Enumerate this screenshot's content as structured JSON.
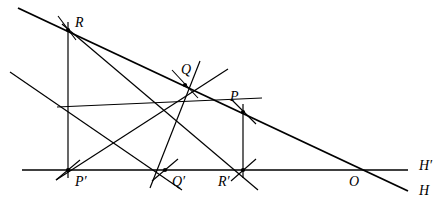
{
  "figure": {
    "background_color": "#ffffff",
    "stroke_color": "#000000",
    "canvas": {
      "width": 448,
      "height": 224
    },
    "points": [
      {
        "id": "R",
        "label": "R",
        "x": 68,
        "y": 30,
        "label_x": 75,
        "label_y": 16,
        "marked": true
      },
      {
        "id": "Q",
        "label": "Q",
        "x": 185,
        "y": 85,
        "label_x": 181,
        "label_y": 63,
        "marked": true
      },
      {
        "id": "P",
        "label": "P",
        "x": 243,
        "y": 112,
        "label_x": 230,
        "label_y": 90,
        "marked": true
      },
      {
        "id": "Pp",
        "label": "P′",
        "x": 68,
        "y": 170,
        "label_x": 75,
        "label_y": 175,
        "marked": true
      },
      {
        "id": "Qp",
        "label": "Q′",
        "x": 165,
        "y": 170,
        "label_x": 172,
        "label_y": 175,
        "marked": true
      },
      {
        "id": "Rp",
        "label": "R′",
        "x": 243,
        "y": 170,
        "label_x": 218,
        "label_y": 175,
        "marked": true
      },
      {
        "id": "O",
        "label": "O",
        "x": 355,
        "y": 168,
        "label_x": 349,
        "label_y": 175,
        "marked": false
      }
    ],
    "axis_labels": [
      {
        "id": "Hp",
        "label": "H′",
        "x": 419,
        "y": 159
      },
      {
        "id": "H",
        "label": "H",
        "x": 419,
        "y": 184
      }
    ],
    "lines": [
      {
        "name": "axis-horizontal-HH-prime",
        "x1": 22,
        "y1": 170,
        "x2": 408,
        "y2": 170,
        "width": 1.6
      },
      {
        "name": "line-H-through-R-O",
        "x1": 18,
        "y1": 8,
        "x2": 408,
        "y2": 191,
        "width": 1.9
      },
      {
        "name": "line-R-to-P-prime",
        "x1": 68,
        "y1": 22,
        "x2": 68,
        "y2": 178,
        "width": 1.2
      },
      {
        "name": "line-P-to-R-prime",
        "x1": 243,
        "y1": 104,
        "x2": 243,
        "y2": 178,
        "width": 1.2
      },
      {
        "name": "line-R-to-R-prime",
        "x1": 62,
        "y1": 24,
        "x2": 258,
        "y2": 190,
        "width": 1.2
      },
      {
        "name": "line-P-prime-to-Q",
        "x1": 56,
        "y1": 180,
        "x2": 228,
        "y2": 69,
        "width": 1.2
      },
      {
        "name": "line-Q-to-Q-prime",
        "x1": 200,
        "y1": 61,
        "x2": 150,
        "y2": 188,
        "width": 1.2
      },
      {
        "name": "line-Q-prime-to-P",
        "x1": 57,
        "y1": 107,
        "x2": 262,
        "y2": 98,
        "width": 1.2
      },
      {
        "name": "line-Q-prime-diagonal",
        "x1": 10,
        "y1": 72,
        "x2": 182,
        "y2": 190,
        "width": 1.2
      }
    ],
    "tick_marks": [
      {
        "name": "tick-at-R",
        "x1": 58,
        "y1": 16,
        "x2": 76,
        "y2": 40
      },
      {
        "name": "tick-at-Q",
        "x1": 172,
        "y1": 70,
        "x2": 198,
        "y2": 98
      },
      {
        "name": "tick-at-P",
        "x1": 231,
        "y1": 99,
        "x2": 256,
        "y2": 124
      },
      {
        "name": "tick-at-P-prime",
        "x1": 56,
        "y1": 180,
        "x2": 80,
        "y2": 160
      },
      {
        "name": "tick-at-Q-prime",
        "x1": 152,
        "y1": 181,
        "x2": 178,
        "y2": 159
      },
      {
        "name": "tick-at-R-prime",
        "x1": 231,
        "y1": 181,
        "x2": 256,
        "y2": 159
      }
    ]
  }
}
